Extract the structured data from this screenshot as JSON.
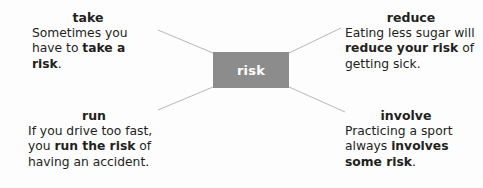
{
  "diagram": {
    "center": {
      "label": "risk",
      "fill_color": "#8c8c8c",
      "text_color": "#ffffff"
    },
    "branches": [
      {
        "id": "take",
        "heading": "take",
        "sentence_before": "Sometimes you have to ",
        "sentence_bold": "take a risk",
        "sentence_after": "."
      },
      {
        "id": "reduce",
        "heading": "reduce",
        "sentence_before": "Eating less sugar will ",
        "sentence_bold": "reduce your risk",
        "sentence_after": " of getting sick."
      },
      {
        "id": "run",
        "heading": "run",
        "sentence_before": "If you drive too fast, you ",
        "sentence_bold": "run the risk",
        "sentence_after": " of having an accident."
      },
      {
        "id": "involve",
        "heading": "involve",
        "sentence_before": "Practicing a sport always ",
        "sentence_bold": "involves some risk",
        "sentence_after": "."
      }
    ],
    "connector_color": "#b8b8b8"
  }
}
